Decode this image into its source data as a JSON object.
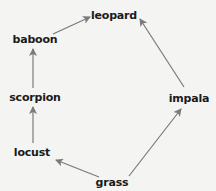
{
  "diagram": {
    "type": "food-web",
    "nodes": [
      {
        "id": "leopard",
        "label": "leopard",
        "x": 114,
        "y": 15
      },
      {
        "id": "baboon",
        "label": "baboon",
        "x": 35,
        "y": 39
      },
      {
        "id": "scorpion",
        "label": "scorpion",
        "x": 35,
        "y": 97
      },
      {
        "id": "impala",
        "label": "impala",
        "x": 189,
        "y": 98
      },
      {
        "id": "locust",
        "label": "locust",
        "x": 32,
        "y": 152
      },
      {
        "id": "grass",
        "label": "grass",
        "x": 112,
        "y": 182
      }
    ],
    "edges": [
      {
        "from": "baboon",
        "to": "leopard"
      },
      {
        "from": "scorpion",
        "to": "baboon"
      },
      {
        "from": "locust",
        "to": "scorpion"
      },
      {
        "from": "grass",
        "to": "locust"
      },
      {
        "from": "grass",
        "to": "impala"
      },
      {
        "from": "impala",
        "to": "leopard"
      }
    ],
    "colors": {
      "background": "#f4f4f3",
      "arrow": "#7a7a7a",
      "text": "#1a1a1a"
    }
  }
}
